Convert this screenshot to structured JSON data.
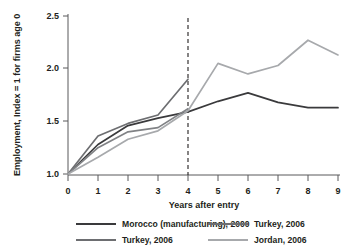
{
  "chart_data": {
    "type": "line",
    "title": "",
    "xlabel": "Years after entry",
    "ylabel": "Employment, Index = 1 for firms age 0",
    "x": [
      0,
      1,
      2,
      3,
      4,
      5,
      6,
      7,
      8,
      9
    ],
    "xlim": [
      0,
      9
    ],
    "ylim": [
      1.0,
      2.5
    ],
    "yticks": [
      "1.0",
      "1.5",
      "2.0",
      "2.5"
    ],
    "ytick_values": [
      1.0,
      1.5,
      2.0,
      2.5
    ],
    "xticks": [
      "0",
      "1",
      "2",
      "3",
      "4",
      "5",
      "6",
      "7",
      "8",
      "9"
    ],
    "grid": false,
    "legend_position": "bottom",
    "annotations": [
      {
        "name": "vertical-reference-line",
        "type": "vline",
        "x": 4,
        "style": "dashed"
      }
    ],
    "series": [
      {
        "name": "Morocco (manufacturing), 2000",
        "color": "#3a3a3c",
        "x": [
          0,
          1,
          2,
          3,
          4,
          5,
          6,
          7,
          8,
          9
        ],
        "values": [
          1.0,
          1.28,
          1.46,
          1.53,
          1.59,
          1.69,
          1.77,
          1.68,
          1.63,
          1.63
        ]
      },
      {
        "name": "Turkey, 2006",
        "color": "#6d6e71",
        "x": [
          0,
          1,
          2,
          3,
          4
        ],
        "values": [
          1.0,
          1.36,
          1.48,
          1.56,
          1.9
        ]
      },
      {
        "name": "Turkey, 2006",
        "color": "#808285",
        "x": [
          0,
          1,
          2,
          3,
          4
        ],
        "values": [
          1.0,
          1.25,
          1.4,
          1.44,
          1.62
        ]
      },
      {
        "name": "Jordan, 2006",
        "color": "#a7a9ac",
        "x": [
          0,
          1,
          2,
          3,
          4,
          5,
          6,
          7,
          8,
          9
        ],
        "values": [
          1.0,
          1.16,
          1.33,
          1.41,
          1.6,
          2.05,
          1.95,
          2.03,
          2.27,
          2.13
        ]
      }
    ]
  },
  "axes": {
    "y_title": "Employment, Index = 1 for firms age 0",
    "x_title": "Years after entry",
    "y_tick_labels": [
      "2.5",
      "2.0",
      "1.5",
      "1.0"
    ],
    "x_tick_labels": [
      "0",
      "1",
      "2",
      "3",
      "4",
      "5",
      "6",
      "7",
      "8",
      "9"
    ]
  },
  "legend": {
    "entries": [
      {
        "label": "Morocco (manufacturing), 2000",
        "color": "#3a3a3c"
      },
      {
        "label": "Turkey, 2006",
        "color": "#6d6e71"
      },
      {
        "label": "Turkey, 2006",
        "color": "#6d6e71"
      },
      {
        "label": "Jordan, 2006",
        "color": "#a7a9ac"
      }
    ]
  }
}
